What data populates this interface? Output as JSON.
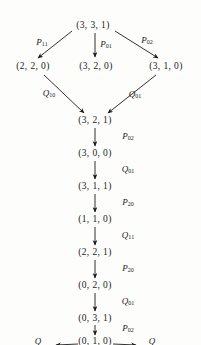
{
  "diagram": {
    "nodes": [
      {
        "id": "n-root",
        "label": "(3, 3, 1)",
        "x": 93,
        "y": 25
      },
      {
        "id": "n-left1",
        "label": "(2, 2, 0)",
        "x": 33,
        "y": 66
      },
      {
        "id": "n-mid1",
        "label": "(3, 2, 0)",
        "x": 96,
        "y": 66
      },
      {
        "id": "n-right1",
        "label": "(3, 1, 0)",
        "x": 166,
        "y": 66
      },
      {
        "id": "n-c1",
        "label": "(3, 2, 1)",
        "x": 95,
        "y": 120
      },
      {
        "id": "n-c2",
        "label": "(3, 0, 0)",
        "x": 95,
        "y": 153
      },
      {
        "id": "n-c3",
        "label": "(3, 1, 1)",
        "x": 95,
        "y": 186
      },
      {
        "id": "n-c4",
        "label": "(1, 1, 0)",
        "x": 95,
        "y": 219
      },
      {
        "id": "n-c5",
        "label": "(2, 2, 1)",
        "x": 95,
        "y": 252
      },
      {
        "id": "n-c6",
        "label": "(0, 2, 0)",
        "x": 95,
        "y": 285
      },
      {
        "id": "n-c7",
        "label": "(0, 3, 1)",
        "x": 95,
        "y": 318
      },
      {
        "id": "n-c8",
        "label": "(0, 1, 0)",
        "x": 95,
        "y": 341
      }
    ],
    "edge_labels": [
      {
        "id": "lbl-p11",
        "op": "P",
        "sub": "11",
        "x": 42,
        "y": 42
      },
      {
        "id": "lbl-p01",
        "op": "P",
        "sub": "01",
        "x": 106,
        "y": 44
      },
      {
        "id": "lbl-p02-a",
        "op": "P",
        "sub": "02",
        "x": 147,
        "y": 40
      },
      {
        "id": "lbl-q10",
        "op": "Q",
        "sub": "10",
        "x": 49,
        "y": 93
      },
      {
        "id": "lbl-q01-a",
        "op": "Q",
        "sub": "01",
        "x": 135,
        "y": 94
      },
      {
        "id": "lbl-p02-b",
        "op": "P",
        "sub": "02",
        "x": 128,
        "y": 136
      },
      {
        "id": "lbl-q01-b",
        "op": "Q",
        "sub": "01",
        "x": 128,
        "y": 169
      },
      {
        "id": "lbl-p20-a",
        "op": "P",
        "sub": "20",
        "x": 128,
        "y": 202
      },
      {
        "id": "lbl-q11",
        "op": "Q",
        "sub": "11",
        "x": 128,
        "y": 235
      },
      {
        "id": "lbl-p20-b",
        "op": "P",
        "sub": "20",
        "x": 128,
        "y": 268
      },
      {
        "id": "lbl-q01-c",
        "op": "Q",
        "sub": "01",
        "x": 128,
        "y": 301
      },
      {
        "id": "lbl-p02-c",
        "op": "P",
        "sub": "02",
        "x": 128,
        "y": 328
      },
      {
        "id": "lbl-q-bl",
        "op": "Q",
        "sub": "",
        "x": 38,
        "y": 341
      },
      {
        "id": "lbl-q-br",
        "op": "Q",
        "sub": "",
        "x": 152,
        "y": 341
      }
    ],
    "colors": {
      "ink": "#1a1a1a",
      "background": "#fdfdfc"
    }
  }
}
